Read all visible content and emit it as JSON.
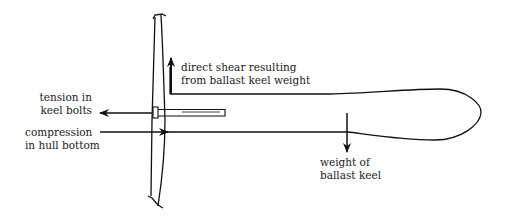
{
  "diagram": {
    "labels": {
      "shear": {
        "line1": "direct shear resulting",
        "line2": "from ballast keel weight"
      },
      "tension": {
        "line1": "tension in",
        "line2": "keel bolts"
      },
      "compression": {
        "line1": "compression",
        "line2": "in hull bottom"
      },
      "weight": {
        "line1": "weight of",
        "line2": "ballast keel"
      }
    },
    "arrows": [
      {
        "name": "shear-arrow",
        "direction": "up"
      },
      {
        "name": "tension-arrow",
        "direction": "left"
      },
      {
        "name": "compression-arrow",
        "direction": "right"
      },
      {
        "name": "weight-arrow",
        "direction": "down"
      }
    ],
    "colors": {
      "stroke": "#111111",
      "background": "#ffffff"
    }
  }
}
